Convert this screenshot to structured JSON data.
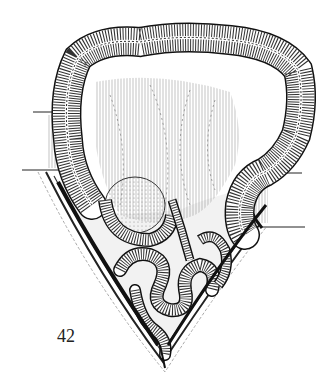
{
  "figure": {
    "number_label": "42",
    "colors": {
      "ink": "#1a1a1a",
      "background": "#ffffff",
      "hatch": "#555555"
    }
  }
}
